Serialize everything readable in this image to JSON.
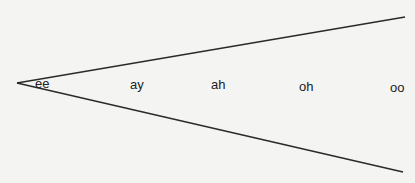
{
  "diagram": {
    "type": "vowel-wedge",
    "background": "#f4f4f2",
    "line_color": "#2a2a2a",
    "vertex": [
      17,
      83
    ],
    "upper_end": [
      405,
      17
    ],
    "lower_end": [
      403,
      172
    ],
    "vowels": [
      {
        "label": "ee",
        "x": 35,
        "y": 77
      },
      {
        "label": "ay",
        "x": 130,
        "y": 78
      },
      {
        "label": "ah",
        "x": 211,
        "y": 78
      },
      {
        "label": "oh",
        "x": 299,
        "y": 80
      },
      {
        "label": "oo",
        "x": 390,
        "y": 81
      }
    ]
  }
}
